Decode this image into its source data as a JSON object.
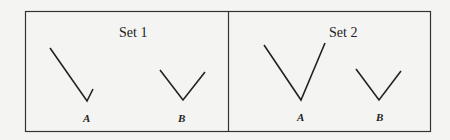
{
  "figure": {
    "panels": [
      {
        "title": "Set 1",
        "angles": [
          {
            "label": "A",
            "points": [
              [
                50,
                48
              ],
              [
                87,
                101
              ],
              [
                93,
                89
              ]
            ]
          },
          {
            "label": "B",
            "points": [
              [
                160,
                70
              ],
              [
                183,
                100
              ],
              [
                205,
                72
              ]
            ]
          }
        ]
      },
      {
        "title": "Set 2",
        "angles": [
          {
            "label": "A",
            "points": [
              [
                264,
                45
              ],
              [
                301,
                100
              ],
              [
                325,
                43
              ]
            ]
          },
          {
            "label": "B",
            "points": [
              [
                356,
                69
              ],
              [
                379,
                100
              ],
              [
                401,
                71
              ]
            ]
          }
        ]
      }
    ],
    "colors": {
      "line": "#222222",
      "border": "#333333",
      "background": "#f4f4f2"
    }
  }
}
